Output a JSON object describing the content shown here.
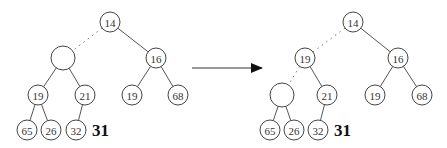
{
  "diagram": {
    "node_radius": 10,
    "hole_radius": 12,
    "trees": [
      {
        "name": "before",
        "nodes": [
          {
            "id": "a",
            "label": "14",
            "x": 110,
            "y": 22
          },
          {
            "id": "b",
            "label": "",
            "x": 63,
            "y": 58,
            "hole": true
          },
          {
            "id": "c",
            "label": "16",
            "x": 156,
            "y": 58
          },
          {
            "id": "d",
            "label": "19",
            "x": 38,
            "y": 95
          },
          {
            "id": "e",
            "label": "21",
            "x": 85,
            "y": 95
          },
          {
            "id": "f",
            "label": "19",
            "x": 132,
            "y": 95
          },
          {
            "id": "g",
            "label": "68",
            "x": 178,
            "y": 95
          },
          {
            "id": "h",
            "label": "65",
            "x": 27,
            "y": 130
          },
          {
            "id": "i",
            "label": "26",
            "x": 51,
            "y": 130
          },
          {
            "id": "j",
            "label": "32",
            "x": 76,
            "y": 130
          }
        ],
        "edges": [
          {
            "from": "a",
            "to": "b",
            "dotted": true
          },
          {
            "from": "a",
            "to": "c"
          },
          {
            "from": "b",
            "to": "d"
          },
          {
            "from": "b",
            "to": "e"
          },
          {
            "from": "c",
            "to": "f"
          },
          {
            "from": "c",
            "to": "g"
          },
          {
            "from": "d",
            "to": "h"
          },
          {
            "from": "d",
            "to": "i"
          },
          {
            "from": "e",
            "to": "j"
          }
        ],
        "pending": {
          "label": "31",
          "x": 92,
          "y": 130
        }
      },
      {
        "name": "after",
        "nodes": [
          {
            "id": "a",
            "label": "14",
            "x": 353,
            "y": 22
          },
          {
            "id": "b",
            "label": "19",
            "x": 305,
            "y": 58
          },
          {
            "id": "c",
            "label": "16",
            "x": 398,
            "y": 58
          },
          {
            "id": "d",
            "label": "",
            "x": 282,
            "y": 95,
            "hole": true
          },
          {
            "id": "e",
            "label": "21",
            "x": 327,
            "y": 95
          },
          {
            "id": "f",
            "label": "19",
            "x": 375,
            "y": 95
          },
          {
            "id": "g",
            "label": "68",
            "x": 422,
            "y": 95
          },
          {
            "id": "h",
            "label": "65",
            "x": 270,
            "y": 130
          },
          {
            "id": "i",
            "label": "26",
            "x": 294,
            "y": 130
          },
          {
            "id": "j",
            "label": "32",
            "x": 318,
            "y": 130
          }
        ],
        "edges": [
          {
            "from": "a",
            "to": "b",
            "dotted": true
          },
          {
            "from": "a",
            "to": "c"
          },
          {
            "from": "b",
            "to": "d",
            "dotted": true
          },
          {
            "from": "b",
            "to": "e"
          },
          {
            "from": "c",
            "to": "f"
          },
          {
            "from": "c",
            "to": "g"
          },
          {
            "from": "d",
            "to": "h"
          },
          {
            "from": "d",
            "to": "i"
          },
          {
            "from": "e",
            "to": "j"
          }
        ],
        "pending": {
          "label": "31",
          "x": 334,
          "y": 130
        }
      }
    ],
    "arrow": {
      "x1": 192,
      "y1": 68,
      "x2": 262,
      "y2": 68
    }
  }
}
